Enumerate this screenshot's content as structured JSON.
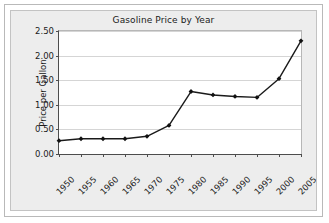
{
  "chart_data": {
    "type": "line",
    "title": "Gasoline Price by Year",
    "xlabel": "",
    "ylabel": "Price per Gallon",
    "categories": [
      "1950",
      "1955",
      "1960",
      "1965",
      "1970",
      "1975",
      "1980",
      "1985",
      "1990",
      "1995",
      "2000",
      "2005"
    ],
    "values": [
      0.27,
      0.31,
      0.31,
      0.31,
      0.36,
      0.58,
      1.27,
      1.2,
      1.17,
      1.15,
      1.53,
      2.3
    ],
    "series": [
      {
        "name": "Price per Gallon",
        "values": [
          0.27,
          0.31,
          0.31,
          0.31,
          0.36,
          0.58,
          1.27,
          1.2,
          1.17,
          1.15,
          1.53,
          2.3
        ]
      }
    ],
    "ylim": [
      0.0,
      2.5
    ],
    "ytick_labels": [
      "0.00",
      "0.50",
      "1.00",
      "1.50",
      "2.00",
      "2.50"
    ],
    "ytick_values": [
      0.0,
      0.5,
      1.0,
      1.5,
      2.0,
      2.5
    ],
    "grid": true,
    "grid_axis": "y",
    "legend": false,
    "legend_position": "none",
    "marker": "diamond",
    "line_color": "#1a1a1a",
    "marker_color": "#111111",
    "plot_background": "#ffffff",
    "panel_background": "#ededed",
    "gridline_color": "#d5d5d5",
    "axis_color": "#4d4d4d",
    "xtick_label_rotation": -45
  }
}
